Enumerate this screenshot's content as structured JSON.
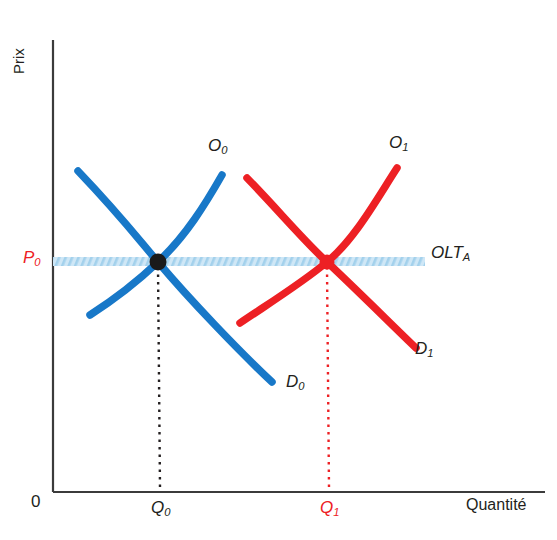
{
  "figure": {
    "type": "economics-supply-demand-diagram",
    "axes": {
      "y_label": "Prix",
      "x_label": "Quantité",
      "origin_label": "0",
      "axis_color": "#3b3b3b"
    },
    "colors": {
      "initial": "#1878c8",
      "shifted": "#ed2024",
      "price_line": "#b9ddf1",
      "text": "#231f20"
    },
    "series": [
      {
        "name": "supply-initial",
        "label": "O",
        "subscript": "0",
        "color": "#1878c8",
        "role": "offre"
      },
      {
        "name": "demand-initial",
        "label": "D",
        "subscript": "0",
        "color": "#1878c8",
        "role": "demande"
      },
      {
        "name": "supply-shifted",
        "label": "O",
        "subscript": "1",
        "color": "#ed2024",
        "role": "offre"
      },
      {
        "name": "demand-shifted",
        "label": "D",
        "subscript": "1",
        "color": "#ed2024",
        "role": "demande"
      }
    ],
    "price_line": {
      "label": "OLT",
      "subscript": "A",
      "color": "#b9ddf1",
      "style": "hatched-band"
    },
    "equilibria": [
      {
        "name": "equilibrium-initial",
        "price_label": "P",
        "price_subscript": "0",
        "quantity_label": "Q",
        "quantity_subscript": "0",
        "color": "#231f20",
        "x": 158,
        "y": 262
      },
      {
        "name": "equilibrium-shifted",
        "quantity_label": "Q",
        "quantity_subscript": "1",
        "color": "#ed2024",
        "x": 327,
        "y": 262
      }
    ]
  }
}
